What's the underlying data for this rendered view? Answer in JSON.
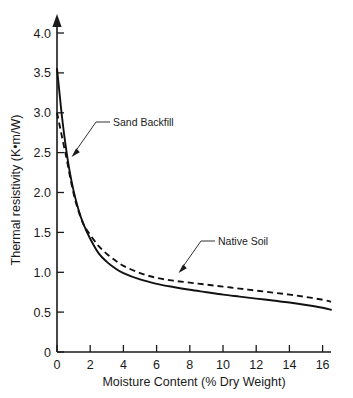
{
  "chart_data": {
    "type": "line",
    "title": "",
    "xlabel": "Moisture Content (% Dry Weight)",
    "ylabel": "Thermal resistivity (K•m/W)",
    "xlim": [
      0,
      16.5
    ],
    "ylim": [
      0,
      4.0
    ],
    "xticks": [
      "0",
      "2",
      "4",
      "6",
      "8",
      "10",
      "12",
      "14",
      "16"
    ],
    "xtick_values": [
      0,
      2,
      4,
      6,
      8,
      10,
      12,
      14,
      16
    ],
    "yticks": [
      "0",
      "0.5",
      "1.0",
      "1.5",
      "2.0",
      "2.5",
      "3.0",
      "3.5",
      "4.0"
    ],
    "ytick_values": [
      0,
      0.5,
      1.0,
      1.5,
      2.0,
      2.5,
      3.0,
      3.5,
      4.0
    ],
    "grid": false,
    "legend_position": "inline-annotations",
    "y_axis_arrow": true,
    "series": [
      {
        "name": "Sand Backfill",
        "style": "solid",
        "color": "#111111",
        "x": [
          0.0,
          0.15,
          0.3,
          0.5,
          0.75,
          1.0,
          1.3,
          1.6,
          2.0,
          2.5,
          3.0,
          3.5,
          4.0,
          5.0,
          6.0,
          7.0,
          8.0,
          9.0,
          10.0,
          11.0,
          12.0,
          13.0,
          14.0,
          15.0,
          16.0,
          16.5
        ],
        "y": [
          3.55,
          3.25,
          2.95,
          2.62,
          2.28,
          2.02,
          1.78,
          1.6,
          1.42,
          1.24,
          1.13,
          1.05,
          0.99,
          0.91,
          0.855,
          0.815,
          0.78,
          0.75,
          0.72,
          0.695,
          0.67,
          0.645,
          0.62,
          0.59,
          0.555,
          0.53
        ]
      },
      {
        "name": "Native Soil",
        "style": "dashed",
        "color": "#111111",
        "x": [
          0.0,
          0.2,
          0.4,
          0.6,
          0.9,
          1.2,
          1.6,
          2.0,
          2.5,
          3.0,
          3.5,
          4.0,
          5.0,
          6.0,
          7.0,
          8.0,
          9.0,
          10.0,
          11.0,
          12.0,
          13.0,
          14.0,
          15.0,
          16.0,
          16.5
        ],
        "y": [
          3.0,
          2.8,
          2.6,
          2.4,
          2.08,
          1.83,
          1.6,
          1.47,
          1.33,
          1.23,
          1.15,
          1.08,
          0.99,
          0.93,
          0.895,
          0.87,
          0.845,
          0.82,
          0.795,
          0.77,
          0.745,
          0.72,
          0.69,
          0.655,
          0.63
        ]
      }
    ],
    "annotations": [
      {
        "text": "Sand Backfill",
        "label_x": 113,
        "label_y": 127,
        "points_to_series": "Sand Backfill"
      },
      {
        "text": "Native Soil",
        "label_x": 218,
        "label_y": 246,
        "points_to_series": "Native Soil"
      }
    ]
  }
}
